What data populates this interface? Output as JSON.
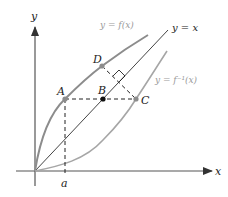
{
  "diagram": {
    "type": "inverse-function-reflection",
    "axes": {
      "x_label": "x",
      "y_label": "y",
      "tick_label": "a",
      "color": "#555555"
    },
    "curves": {
      "f": {
        "label": "y = f(x)",
        "color": "#8c8c8c"
      },
      "f_inverse": {
        "label": "y = f⁻¹(x)",
        "color": "#a6a6a6"
      },
      "identity": {
        "label": "y = x",
        "color": "#444444"
      }
    },
    "points": {
      "A": {
        "label": "A",
        "color": "#8c8c8c"
      },
      "B": {
        "label": "B",
        "color": "#111111"
      },
      "C": {
        "label": "C",
        "color": "#8c8c8c"
      },
      "D": {
        "label": "D",
        "color": "#8c8c8c"
      }
    },
    "annotations": {
      "right_angle_marker": "DB ⊥ y = x",
      "dashed_segments": [
        "A to C (horizontal)",
        "D to C (perpendicular to y = x)",
        "A to a (vertical)"
      ]
    }
  }
}
